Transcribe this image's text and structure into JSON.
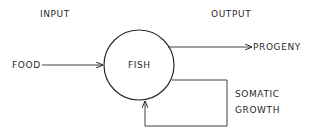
{
  "headers": {
    "input": "INPUT",
    "output": "OUTPUT"
  },
  "nodes": {
    "center": "FISH",
    "input": "FOOD",
    "output": "PROGENY",
    "feedback_line1": "SOMATIC",
    "feedback_line2": "GROWTH"
  },
  "edges": [
    {
      "from": "FOOD",
      "to": "FISH"
    },
    {
      "from": "FISH",
      "to": "PROGENY"
    },
    {
      "from": "FISH",
      "to": "FISH",
      "label": "SOMATIC GROWTH"
    }
  ],
  "colors": {
    "stroke": "#2a2a2a",
    "background": "#ffffff"
  }
}
